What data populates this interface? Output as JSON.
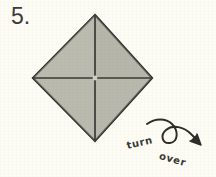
{
  "page": {
    "background_color": "#fdfdf6",
    "width": 216,
    "height": 177
  },
  "step": {
    "label": "5.",
    "name": "step-number"
  },
  "figure": {
    "name": "origami-diamond",
    "shape": "diamond",
    "fill_color": "#b9b9ad",
    "outline_color": "#2b2b28",
    "crease_color": "#3a3a36",
    "vertices": {
      "top": [
        95,
        15
      ],
      "right": [
        152,
        78
      ],
      "bottom": [
        95,
        141
      ],
      "left": [
        33,
        78
      ]
    },
    "creases": [
      {
        "name": "vertical-crease",
        "from": [
          95,
          15
        ],
        "to": [
          95,
          141
        ]
      },
      {
        "name": "horizontal-crease",
        "from": [
          33,
          78
        ],
        "to": [
          152,
          78
        ]
      }
    ],
    "center_point": [
      95,
      78
    ]
  },
  "annotation": {
    "name": "turn-over-annotation",
    "words": {
      "first": "turn",
      "second": "over"
    },
    "arrow": {
      "name": "turn-over-arrow",
      "color": "#2d2d2a",
      "loop_center": [
        172,
        134
      ],
      "loop_radius": 9,
      "head_tip": [
        202,
        145
      ]
    }
  }
}
